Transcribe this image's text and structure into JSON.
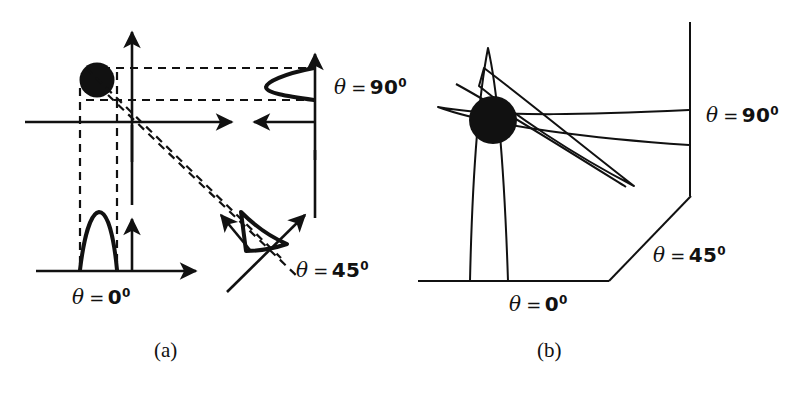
{
  "figure": {
    "background_color": "#ffffff",
    "ink_color": "#111111",
    "width": 799,
    "height": 394
  },
  "panels": [
    {
      "id": "a",
      "caption": "(a)",
      "description": "Object point with projection profiles acquired at three view angles; dashed rays show the projection of the dark object onto each detector axis.",
      "object": {
        "name": "point-object",
        "shape": "filled-circle",
        "cx": 97,
        "cy": 80,
        "r": 17
      },
      "axes": [
        {
          "name": "theta-0",
          "label_theta": "θ",
          "label_eq": "=",
          "label_value": "0",
          "label_sup": "0",
          "orientation": "horizontal"
        },
        {
          "name": "theta-45",
          "label_theta": "θ",
          "label_eq": "=",
          "label_value": "45",
          "label_sup": "0",
          "orientation": "diagonal"
        },
        {
          "name": "theta-90",
          "label_theta": "θ",
          "label_eq": "=",
          "label_value": "90",
          "label_sup": "0",
          "orientation": "vertical"
        }
      ]
    },
    {
      "id": "b",
      "caption": "(b)",
      "description": "Simple backprojection: the three profiles are smeared back across the image plane and superimpose at the object location, producing a star artifact.",
      "object": {
        "name": "reconstructed-blob",
        "shape": "filled-circle",
        "cx": 493,
        "cy": 120,
        "r": 24
      },
      "axes": [
        {
          "name": "theta-0",
          "label_theta": "θ",
          "label_eq": "=",
          "label_value": "0",
          "label_sup": "0",
          "orientation": "horizontal"
        },
        {
          "name": "theta-45",
          "label_theta": "θ",
          "label_eq": "=",
          "label_value": "45",
          "label_sup": "0",
          "orientation": "diagonal"
        },
        {
          "name": "theta-90",
          "label_theta": "θ",
          "label_eq": "=",
          "label_value": "90",
          "label_sup": "0",
          "orientation": "vertical"
        }
      ]
    }
  ],
  "labels": {
    "a_theta0": {
      "theta": "θ",
      "eq": "=",
      "value": "0",
      "sup": "0"
    },
    "a_theta45": {
      "theta": "θ",
      "eq": "=",
      "value": "45",
      "sup": "0"
    },
    "a_theta90": {
      "theta": "θ",
      "eq": "=",
      "value": "90",
      "sup": "0"
    },
    "b_theta0": {
      "theta": "θ",
      "eq": "=",
      "value": "0",
      "sup": "0"
    },
    "b_theta45": {
      "theta": "θ",
      "eq": "=",
      "value": "45",
      "sup": "0"
    },
    "b_theta90": {
      "theta": "θ",
      "eq": "=",
      "value": "90",
      "sup": "0"
    },
    "caption_a": "(a)",
    "caption_b": "(b)"
  }
}
